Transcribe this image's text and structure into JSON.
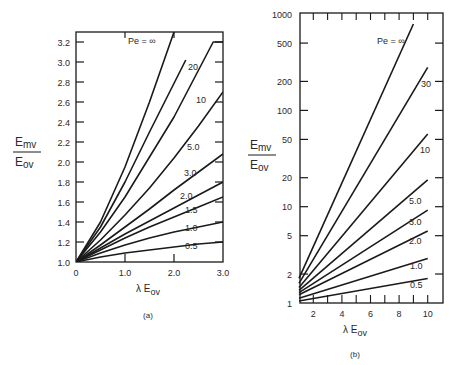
{
  "figure": {
    "panels": [
      "(a)",
      "(b)"
    ]
  },
  "chart_data": [
    {
      "type": "line",
      "panel_label": "(a)",
      "title": "",
      "xlabel": "λ E_ov",
      "ylabel": "E_mv / E_ov",
      "xlim": [
        0,
        3.0
      ],
      "ylim": [
        1.0,
        3.3
      ],
      "yscale": "linear",
      "grid": false,
      "legend_position": "inline curve labels",
      "x_ticks": [
        0,
        1.0,
        2.0,
        3.0
      ],
      "x_tick_labels": [
        "0",
        "1.0",
        "2.0",
        "3.0"
      ],
      "y_ticks": [
        1.0,
        1.2,
        1.4,
        1.6,
        1.8,
        2.0,
        2.2,
        2.4,
        2.6,
        2.8,
        3.0,
        3.2
      ],
      "y_tick_labels": [
        "1.0",
        "1.2",
        "1.4",
        "1.6",
        "1.8",
        "2.0",
        "2.2",
        "2.4",
        "2.6",
        "2.8",
        "3.0",
        "3.2"
      ],
      "series": [
        {
          "name": "Pe = ∞",
          "label": "Pe = ∞",
          "x": [
            0,
            0.5,
            1.0,
            1.5,
            2.0
          ],
          "y": [
            1.0,
            1.4,
            1.95,
            2.6,
            3.3
          ]
        },
        {
          "name": "20",
          "label": "20",
          "x": [
            0,
            0.5,
            1.0,
            1.5,
            2.24
          ],
          "y": [
            1.0,
            1.35,
            1.8,
            2.3,
            3.02
          ]
        },
        {
          "name": "10",
          "label": "10",
          "x": [
            0,
            0.5,
            1.0,
            1.5,
            2.0,
            2.8,
            3.0
          ],
          "y": [
            1.0,
            1.3,
            1.65,
            2.05,
            2.45,
            3.2,
            3.2
          ]
        },
        {
          "name": "5.0",
          "label": "5.0",
          "x": [
            0,
            0.5,
            1.0,
            1.5,
            2.0,
            2.5,
            3.0
          ],
          "y": [
            1.0,
            1.22,
            1.47,
            1.74,
            2.04,
            2.36,
            2.7
          ]
        },
        {
          "name": "3.0",
          "label": "3.0",
          "x": [
            0,
            0.5,
            1.0,
            1.5,
            2.0,
            2.5,
            3.0
          ],
          "y": [
            1.0,
            1.17,
            1.35,
            1.53,
            1.72,
            1.9,
            2.08
          ]
        },
        {
          "name": "2.0",
          "label": "2.0",
          "x": [
            0,
            0.5,
            1.0,
            1.5,
            2.0,
            2.5,
            3.0
          ],
          "y": [
            1.0,
            1.14,
            1.28,
            1.41,
            1.54,
            1.67,
            1.8
          ]
        },
        {
          "name": "1.5",
          "label": "1.5",
          "x": [
            0,
            0.5,
            1.0,
            1.5,
            2.0,
            2.5,
            3.0
          ],
          "y": [
            1.0,
            1.12,
            1.24,
            1.35,
            1.45,
            1.55,
            1.65
          ]
        },
        {
          "name": "1.0",
          "label": "1.0",
          "x": [
            0,
            0.5,
            1.0,
            1.5,
            2.0,
            2.5,
            3.0
          ],
          "y": [
            1.0,
            1.09,
            1.17,
            1.24,
            1.3,
            1.35,
            1.4
          ]
        },
        {
          "name": "0.5",
          "label": "0.5",
          "x": [
            0,
            0.5,
            1.0,
            1.5,
            2.0,
            2.5,
            3.0
          ],
          "y": [
            1.0,
            1.05,
            1.09,
            1.12,
            1.15,
            1.18,
            1.2
          ]
        }
      ]
    },
    {
      "type": "line",
      "panel_label": "(b)",
      "title": "",
      "xlabel": "λ E_ov",
      "ylabel": "E_mv / E_ov",
      "xlim": [
        1,
        11
      ],
      "ylim": [
        1,
        1000
      ],
      "yscale": "log",
      "grid": false,
      "legend_position": "inline curve labels",
      "x_ticks": [
        2,
        4,
        6,
        8,
        10
      ],
      "x_tick_labels": [
        "2",
        "4",
        "6",
        "8",
        "10"
      ],
      "y_ticks": [
        1,
        2,
        5,
        10,
        20,
        50,
        100,
        200,
        500,
        1000
      ],
      "y_tick_labels": [
        "1",
        "2",
        "5",
        "10",
        "20",
        "50",
        "100",
        "200",
        "500",
        "1000"
      ],
      "series": [
        {
          "name": "Pe = ∞",
          "label": "Pe = ∞",
          "x": [
            1,
            9
          ],
          "y": [
            1.8,
            790
          ]
        },
        {
          "name": "30",
          "label": "30",
          "x": [
            1,
            10
          ],
          "y": [
            1.6,
            280
          ]
        },
        {
          "name": "10",
          "label": "10",
          "x": [
            1,
            10
          ],
          "y": [
            1.45,
            57
          ]
        },
        {
          "name": "5.0",
          "label": "5.0",
          "x": [
            1,
            10
          ],
          "y": [
            1.35,
            19
          ]
        },
        {
          "name": "3.0",
          "label": "3.0",
          "x": [
            1,
            10
          ],
          "y": [
            1.28,
            9.2
          ]
        },
        {
          "name": "2.0",
          "label": "2.0",
          "x": [
            1,
            10
          ],
          "y": [
            1.22,
            5.6
          ]
        },
        {
          "name": "1.0",
          "label": "1.0",
          "x": [
            1,
            10
          ],
          "y": [
            1.12,
            2.9
          ]
        },
        {
          "name": "0.5",
          "label": "0.5",
          "x": [
            1,
            10
          ],
          "y": [
            1.05,
            1.8
          ]
        }
      ]
    }
  ],
  "axis_text": {
    "ylabel_num": "E",
    "ylabel_num_sub": "mv",
    "ylabel_den": "E",
    "ylabel_den_sub": "ov",
    "xlabel_lambda": "λ E",
    "xlabel_sub": "ov"
  },
  "colors": {
    "line": "#1a1a1a",
    "text": "#2a2a2a",
    "background": "#ffffff"
  }
}
